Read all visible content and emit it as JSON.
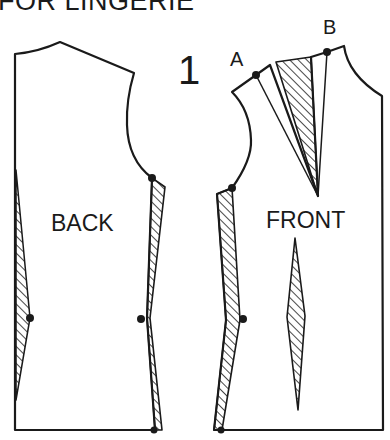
{
  "diagram": {
    "heading": "FOR LINGERIE",
    "figure_number": "1",
    "pieces": [
      {
        "name": "back",
        "label": "BACK"
      },
      {
        "name": "front",
        "label": "FRONT"
      }
    ],
    "points": [
      {
        "name": "A",
        "label": "A"
      },
      {
        "name": "B",
        "label": "B"
      }
    ],
    "colors": {
      "ink": "#1a1a1a",
      "paper": "#ffffff"
    }
  }
}
